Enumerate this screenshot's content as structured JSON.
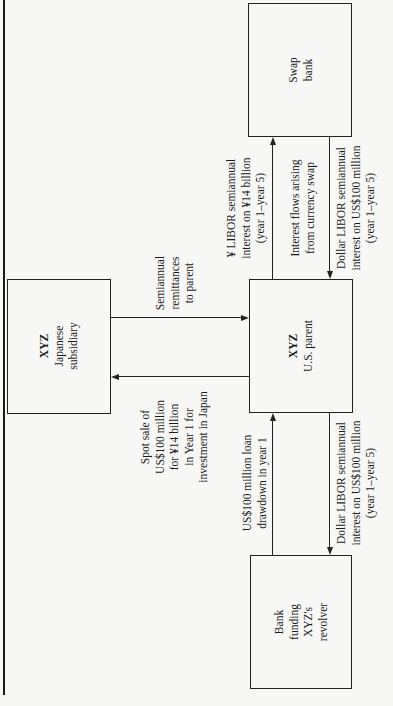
{
  "diagram": {
    "orientation": "rotated 90 degrees counter-clockwise",
    "nodes": {
      "swap_bank": {
        "lines": [
          "Swap",
          "bank"
        ]
      },
      "japanese_subsidiary": {
        "lines": [
          "XYZ",
          "Japanese",
          "subsidiary"
        ]
      },
      "us_parent": {
        "lines": [
          "XYZ",
          "U.S. parent"
        ]
      },
      "bank_funding": {
        "lines": [
          "Bank",
          "funding",
          "XYZ's",
          "revolver"
        ]
      }
    },
    "edges": {
      "yen_libor": {
        "from": "XYZ U.S. parent",
        "to": "Swap bank",
        "lines": [
          "¥ LIBOR semiannual",
          "interest on ¥14 billion",
          "(year 1–year 5)"
        ]
      },
      "swap_note": {
        "lines": [
          "Interest flows arising",
          "from currency swap"
        ]
      },
      "dollar_libor_swap": {
        "from": "Swap bank",
        "to": "XYZ U.S. parent",
        "lines": [
          "Dollar LIBOR semiannual",
          "interest on US$100 million",
          "(year 1–year 5)"
        ]
      },
      "remittances": {
        "from": "XYZ Japanese subsidiary",
        "to": "XYZ U.S. parent",
        "lines": [
          "Semiannual",
          "remittances",
          "to parent"
        ]
      },
      "spot_sale": {
        "from": "XYZ U.S. parent",
        "to": "XYZ Japanese subsidiary",
        "lines": [
          "Spot sale of",
          "US$100 million",
          "for ¥14 billion",
          "in Year 1 for",
          "investment in Japan"
        ]
      },
      "loan_drawdown": {
        "from": "Bank funding XYZ's revolver",
        "to": "XYZ U.S. parent",
        "lines": [
          "US$100 million loan",
          "drawdown in year 1"
        ]
      },
      "dollar_libor_bank": {
        "from": "XYZ U.S. parent",
        "to": "Bank funding XYZ's revolver",
        "lines": [
          "Dollar LIBOR semiannual",
          "interest on US$100 million",
          "(year 1–year 5)"
        ]
      }
    }
  }
}
